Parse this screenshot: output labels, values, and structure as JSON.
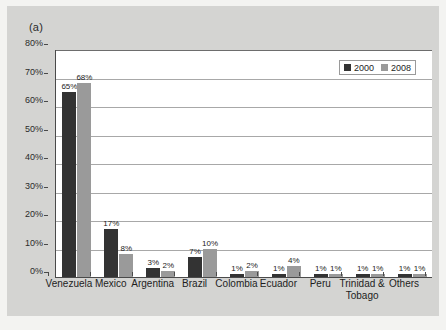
{
  "figure": {
    "panel_letter": "(a)",
    "background_color": "#d4d4d2",
    "plot_background_color": "#ffffff"
  },
  "chart_data": {
    "type": "bar",
    "title": "",
    "subtitle": "",
    "xlabel": "",
    "ylabel": "",
    "ylim": [
      0,
      80
    ],
    "yunit": "%",
    "grid": true,
    "legend_position": "top-right",
    "categories": [
      "Venezuela",
      "Mexico",
      "Argentina",
      "Brazil",
      "Colombia",
      "Ecuador",
      "Peru",
      "Trinidad &\nTobago",
      "Others"
    ],
    "ytick_labels": [
      "0%",
      "10%",
      "20%",
      "30%",
      "40%",
      "50%",
      "60%",
      "70%",
      "80%"
    ],
    "ytick_values": [
      0,
      10,
      20,
      30,
      40,
      50,
      60,
      70,
      80
    ],
    "series": [
      {
        "name": "2000",
        "color": "#333333",
        "values": [
          65,
          17,
          3,
          7,
          1,
          1,
          1,
          1,
          1
        ],
        "data_labels": [
          "65%",
          "17%",
          "3%",
          "7%",
          "1%",
          "1%",
          "1%",
          "1%",
          "1%"
        ]
      },
      {
        "name": "2008",
        "color": "#9a9a9a",
        "values": [
          68,
          8,
          2,
          10,
          2,
          4,
          1,
          1,
          1
        ],
        "data_labels": [
          "68%",
          "8%",
          "2%",
          "10%",
          "2%",
          "4%",
          "1%",
          "1%",
          "1%"
        ]
      }
    ]
  },
  "legend": {
    "entries": [
      {
        "label": "2000",
        "color": "#333333"
      },
      {
        "label": "2008",
        "color": "#9a9a9a"
      }
    ]
  }
}
